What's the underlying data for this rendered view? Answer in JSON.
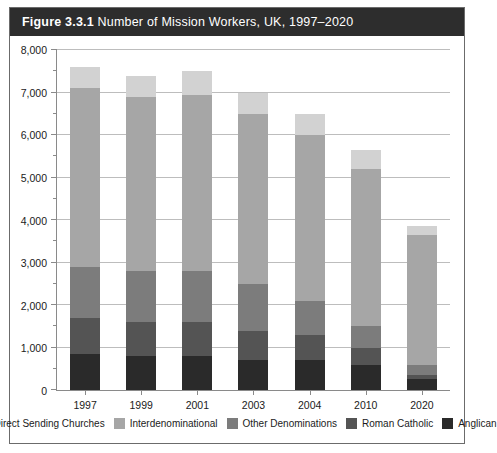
{
  "figure": {
    "label": "Figure 3.3.1",
    "caption": "Number of Mission Workers, UK, 1997–2020"
  },
  "chart_data": {
    "type": "bar",
    "stacked": true,
    "title": "Number of Mission Workers, UK, 1997–2020",
    "xlabel": "",
    "ylabel": "",
    "ylim": [
      0,
      8000
    ],
    "yticks": [
      0,
      1000,
      2000,
      3000,
      4000,
      5000,
      6000,
      7000,
      8000
    ],
    "ytick_labels": [
      "0",
      "1,000",
      "2,000",
      "3,000",
      "4,000",
      "5,000",
      "6,000",
      "7,000",
      "8,000"
    ],
    "minor_tick_step": 500,
    "grid": true,
    "legend_position": "bottom",
    "categories": [
      "1997",
      "1999",
      "2001",
      "2003",
      "2004",
      "2010",
      "2020"
    ],
    "series": [
      {
        "name": "Anglican",
        "color": "#2a2a2a",
        "values": [
          850,
          800,
          800,
          700,
          700,
          600,
          250
        ]
      },
      {
        "name": "Roman Catholic",
        "color": "#545454",
        "values": [
          850,
          800,
          800,
          700,
          600,
          400,
          100
        ]
      },
      {
        "name": "Other Denominations",
        "color": "#7c7c7c",
        "values": [
          1200,
          1200,
          1200,
          1100,
          800,
          500,
          250
        ]
      },
      {
        "name": "Interdenominational",
        "color": "#a6a6a6",
        "values": [
          4200,
          4100,
          4150,
          4000,
          3900,
          3700,
          3050
        ]
      },
      {
        "name": "Direct Sending Churches",
        "color": "#d2d2d2",
        "values": [
          500,
          500,
          550,
          500,
          500,
          450,
          200
        ]
      }
    ],
    "totals": [
      7600,
      7400,
      7500,
      7000,
      6500,
      5650,
      3850
    ],
    "legend_order": [
      "Direct Sending Churches",
      "Interdenominational",
      "Other Denominations",
      "Roman Catholic",
      "Anglican"
    ]
  },
  "colors": {
    "titlebar_background": "#2d2d2d",
    "title_text": "#ffffff",
    "frame_border": "#6b6b6b",
    "grid": "#bdbdbd",
    "axis": "#8a8a8a"
  }
}
